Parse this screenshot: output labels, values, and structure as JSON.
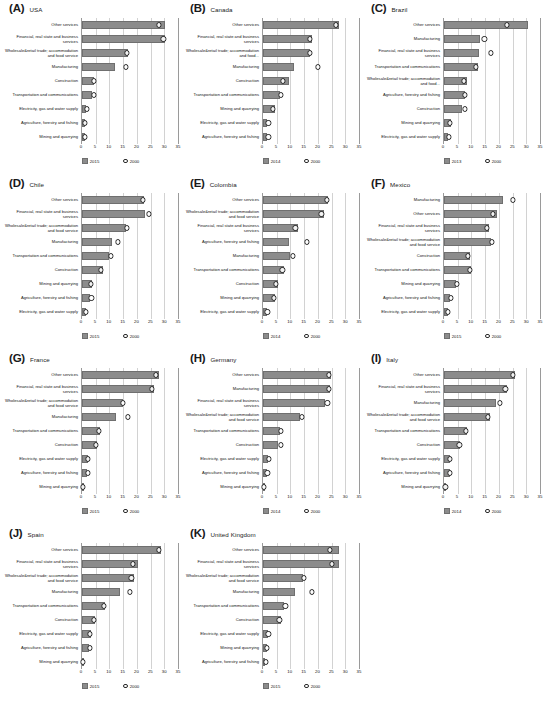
{
  "figure": {
    "axis_ticks": [
      0,
      5,
      10,
      15,
      20,
      25,
      30,
      35
    ],
    "xmax": 35,
    "marker_legend_year": "2000",
    "bar_color": "#8c8c8c",
    "marker_color": "#ffffff"
  },
  "chart_data": {
    "type": "bar",
    "title": "",
    "xlabel": "",
    "ylabel": "",
    "xlim": [
      0,
      35
    ],
    "grid": true,
    "legend_position": "bottom",
    "orientation": "horizontal",
    "series_names": [
      "recent year",
      "2000"
    ],
    "panels": [
      {
        "label": "(A)",
        "country": "USA",
        "legend": {
          "bars": "2015",
          "markers": "2000"
        },
        "categories": [
          "Other services",
          "Financial, real state and business services",
          "Wholesale&retail trade; accommodation and food service",
          "Manufacturing",
          "Construction",
          "Transportation and communications",
          "Electricity, gas and water supply",
          "Agriculture, forestry and fishing",
          "Mining and quarrying"
        ],
        "values_recent": [
          30.2,
          30.4,
          16.6,
          12.2,
          4.3,
          3.6,
          1.5,
          1.1,
          1.0
        ],
        "values_2000": [
          28.1,
          29.7,
          16.3,
          16.0,
          4.4,
          4.2,
          1.7,
          1.1,
          1.1
        ]
      },
      {
        "label": "(B)",
        "country": "Canada",
        "legend": {
          "bars": "2014",
          "markers": "2000"
        },
        "categories": [
          "Other services",
          "Financial, real state and business services",
          "Wholesale&retail trade; accommodation and food...",
          "Manufacturing",
          "Construction",
          "Transportation and communications",
          "Mining and quarrying",
          "Electricity, gas and water supply",
          "Agriculture, forestry and fishing"
        ],
        "values_recent": [
          27.7,
          17.8,
          17.3,
          11.2,
          9.5,
          6.2,
          4.2,
          1.6,
          1.5
        ],
        "values_2000": [
          26.5,
          17.0,
          17.1,
          20.0,
          7.4,
          6.5,
          3.6,
          2.0,
          2.0
        ]
      },
      {
        "label": "(C)",
        "country": "Brazil",
        "legend": {
          "bars": "2013",
          "markers": "2000"
        },
        "categories": [
          "Other services",
          "Manufacturing",
          "Financial, real state and business services",
          "Transportation and communications",
          "Wholesale&retail trade; accommodation and food...",
          "Agriculture, forestry and fishing",
          "Construction",
          "Mining and quarrying",
          "Electricity, gas and water supply"
        ],
        "values_recent": [
          30.5,
          13.3,
          12.8,
          12.4,
          8.3,
          7.8,
          6.5,
          2.6,
          1.5
        ],
        "values_2000": [
          23.0,
          14.7,
          17.2,
          11.6,
          7.3,
          7.6,
          7.5,
          2.2,
          1.9
        ]
      },
      {
        "label": "(D)",
        "country": "Chile",
        "legend": {
          "bars": "2015",
          "markers": "2000"
        },
        "categories": [
          "Other services",
          "Financial, real state and business services",
          "Wholesale&retail trade; accommodation and food service",
          "Manufacturing",
          "Transportation and communications",
          "Construction",
          "Mining and quarrying",
          "Agriculture, forestry and fishing",
          "Electricity, gas and water supply"
        ],
        "values_recent": [
          22.5,
          22.9,
          15.9,
          11.1,
          9.9,
          7.6,
          3.6,
          2.8,
          1.4
        ],
        "values_2000": [
          22.2,
          24.4,
          16.5,
          13.1,
          10.6,
          7.0,
          3.3,
          3.4,
          1.5
        ]
      },
      {
        "label": "(E)",
        "country": "Colombia",
        "legend": {
          "bars": "2014",
          "markers": "2000"
        },
        "categories": [
          "Other services",
          "Wholesale&retail trade; accommodation and food service",
          "Financial, real state and business services",
          "Agriculture, forestry and fishing",
          "Manufacturing",
          "Transportation and communications",
          "Construction",
          "Mining and quarrying",
          "Electricity, gas and water supply"
        ],
        "values_recent": [
          23.6,
          22.4,
          12.6,
          9.4,
          9.7,
          7.8,
          5.6,
          4.3,
          1.4
        ],
        "values_2000": [
          23.4,
          21.3,
          11.8,
          15.9,
          11.0,
          7.1,
          4.7,
          4.1,
          1.6
        ]
      },
      {
        "label": "(F)",
        "country": "Mexico",
        "legend": {
          "bars": "2015",
          "markers": "2000"
        },
        "categories": [
          "Manufacturing",
          "Other services",
          "Financial, real state and business services",
          "Wholesale&retail trade; accommodation and food service",
          "Construction",
          "Transportation and communications",
          "Mining and quarrying",
          "Agriculture, forestry and fishing",
          "Electricity, gas and water supply"
        ],
        "values_recent": [
          21.4,
          19.5,
          16.3,
          17.0,
          9.4,
          9.7,
          4.5,
          2.1,
          1.4
        ],
        "values_2000": [
          25.2,
          17.8,
          15.7,
          17.6,
          8.7,
          9.3,
          4.8,
          2.4,
          1.5
        ]
      },
      {
        "label": "(G)",
        "country": "France",
        "legend": {
          "bars": "2015",
          "markers": "2000"
        },
        "categories": [
          "Other services",
          "Financial, real state and business services",
          "Wholesale&retail trade; accommodation and food service",
          "Manufacturing",
          "Transportation and communications",
          "Construction",
          "Electricity, gas and water supply",
          "Agriculture, forestry and fishing",
          "Mining and quarrying"
        ],
        "values_recent": [
          28.1,
          26.3,
          14.9,
          12.4,
          6.5,
          5.5,
          2.2,
          1.9,
          0.3
        ],
        "values_2000": [
          26.9,
          25.4,
          15.0,
          16.6,
          6.1,
          5.1,
          2.1,
          2.2,
          0.3
        ]
      },
      {
        "label": "(H)",
        "country": "Germany",
        "legend": {
          "bars": "2014",
          "markers": "2000"
        },
        "categories": [
          "Other services",
          "Manufacturing",
          "Financial, real state and business services",
          "Wholesale&retail trade; accommodation and food service",
          "Transportation and communications",
          "Construction",
          "Electricity, gas and water supply",
          "Agriculture, forestry and fishing",
          "Mining and quarrying"
        ],
        "values_recent": [
          24.7,
          24.4,
          22.6,
          13.4,
          6.1,
          5.4,
          2.0,
          1.5,
          0.3
        ],
        "values_2000": [
          24.0,
          24.1,
          23.5,
          14.1,
          6.6,
          6.4,
          2.1,
          1.6,
          0.4
        ]
      },
      {
        "label": "(I)",
        "country": "Italy",
        "legend": {
          "bars": "2014",
          "markers": "2000"
        },
        "categories": [
          "Other services",
          "Financial, real state and business services",
          "Manufacturing",
          "Wholesale&retail trade; accommodation and food service",
          "Transportation and communications",
          "Construction",
          "Electricity, gas and water supply",
          "Agriculture, forestry and fishing",
          "Mining and quarrying"
        ],
        "values_recent": [
          25.8,
          22.8,
          18.8,
          16.6,
          8.5,
          5.7,
          2.3,
          2.1,
          0.5
        ],
        "values_2000": [
          25.1,
          22.4,
          20.4,
          15.9,
          8.1,
          5.6,
          2.2,
          2.2,
          0.5
        ]
      },
      {
        "label": "(J)",
        "country": "Spain",
        "legend": {
          "bars": "2015",
          "markers": "2000"
        },
        "categories": [
          "Other services",
          "Financial, real state and business services",
          "Wholesale&retail trade; accommodation and food service",
          "Manufacturing",
          "Transportation and communications",
          "Construction",
          "Electricity, gas and water supply",
          "Agriculture, forestry and fishing",
          "Mining and quarrying"
        ],
        "values_recent": [
          28.8,
          20.4,
          19.1,
          13.8,
          8.4,
          4.9,
          3.1,
          2.6,
          0.3
        ],
        "values_2000": [
          28.0,
          18.7,
          18.0,
          17.5,
          8.0,
          4.4,
          3.0,
          3.0,
          0.4
        ]
      },
      {
        "label": "(K)",
        "country": "United Kingdom",
        "legend": {
          "bars": "2015",
          "markers": "2000"
        },
        "categories": [
          "Other services",
          "Financial, real state and business services",
          "Wholesale&retail trade; accommodation and food service",
          "Manufacturing",
          "Transportation and communications",
          "Construction",
          "Electricity, gas and water supply",
          "Mining and quarrying",
          "Agriculture, forestry and fishing"
        ],
        "values_recent": [
          27.7,
          27.6,
          14.6,
          11.5,
          7.6,
          6.7,
          1.8,
          1.3,
          0.9
        ],
        "values_2000": [
          24.5,
          25.0,
          15.0,
          17.7,
          8.2,
          6.0,
          2.0,
          1.5,
          1.0
        ]
      }
    ]
  }
}
